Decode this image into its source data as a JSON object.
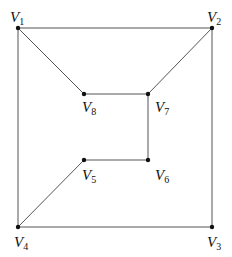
{
  "graph": {
    "vertices": [
      {
        "id": "V1",
        "label": "V",
        "sub": "1",
        "x": 18,
        "y": 28,
        "lx": 10,
        "ly": 22
      },
      {
        "id": "V2",
        "label": "V",
        "sub": "2",
        "x": 212,
        "y": 28,
        "lx": 207,
        "ly": 22
      },
      {
        "id": "V3",
        "label": "V",
        "sub": "3",
        "x": 212,
        "y": 227,
        "lx": 207,
        "ly": 247
      },
      {
        "id": "V4",
        "label": "V",
        "sub": "4",
        "x": 18,
        "y": 227,
        "lx": 14,
        "ly": 247
      },
      {
        "id": "V5",
        "label": "V",
        "sub": "5",
        "x": 84,
        "y": 160,
        "lx": 82,
        "ly": 180
      },
      {
        "id": "V6",
        "label": "V",
        "sub": "6",
        "x": 148,
        "y": 160,
        "lx": 155,
        "ly": 180
      },
      {
        "id": "V7",
        "label": "V",
        "sub": "7",
        "x": 148,
        "y": 94,
        "lx": 155,
        "ly": 112
      },
      {
        "id": "V8",
        "label": "V",
        "sub": "8",
        "x": 84,
        "y": 94,
        "lx": 82,
        "ly": 112
      }
    ],
    "edges": [
      [
        "V1",
        "V2"
      ],
      [
        "V2",
        "V3"
      ],
      [
        "V3",
        "V4"
      ],
      [
        "V4",
        "V1"
      ],
      [
        "V1",
        "V8"
      ],
      [
        "V8",
        "V7"
      ],
      [
        "V7",
        "V2"
      ],
      [
        "V7",
        "V6"
      ],
      [
        "V6",
        "V5"
      ],
      [
        "V5",
        "V4"
      ]
    ],
    "colors": {
      "edge": "#555555",
      "vertex": "#111111"
    }
  }
}
